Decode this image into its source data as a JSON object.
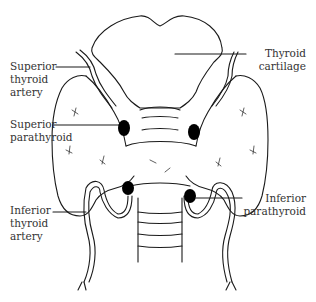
{
  "diagram": {
    "colors": {
      "line": "#1a1a1a",
      "text": "#333333",
      "background": "#ffffff",
      "gland_fill": "#000000"
    },
    "labels": {
      "superior_thyroid_artery": "Superior\nthyroid\nartery",
      "thyroid_cartilage": "Thyroid\ncartilage",
      "superior_parathyroid": "Superior\nparathyroid",
      "inferior_thyroid_artery": "Inferior\nthyroid\nartery",
      "inferior_parathyroid": "Inferior\nparathyroid"
    }
  }
}
